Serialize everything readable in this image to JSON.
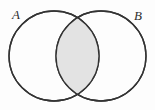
{
  "figure": {
    "kind": "venn-diagram",
    "title": "",
    "background_color": "#fdfdfd",
    "width": 155,
    "height": 110
  },
  "sets": [
    {
      "id": "A",
      "label": "A",
      "label_x": 16,
      "label_y": 19,
      "center_x": 54,
      "center_y": 56,
      "radius": 45,
      "fill_color": "#ffffff",
      "stroke_color": "#333333"
    },
    {
      "id": "B",
      "label": "B",
      "label_x": 133,
      "label_y": 20,
      "center_x": 101,
      "center_y": 56,
      "radius": 45,
      "fill_color": "#ffffff",
      "stroke_color": "#333333"
    }
  ],
  "shaded_region": {
    "name": "intersection",
    "notation": "A ∩ B",
    "fill_color": "#e3e3e3",
    "stroke_color": "#333333",
    "shaded": true
  },
  "style": {
    "stroke_color": "#333333",
    "stroke_width": 1.3,
    "unshaded_fill": "#ffffff"
  }
}
